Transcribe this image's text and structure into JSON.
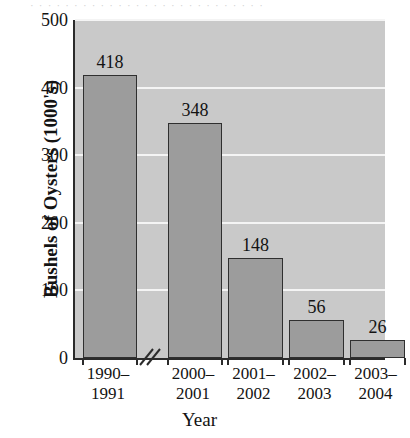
{
  "chart_data": {
    "type": "bar",
    "title": "",
    "xlabel": "Year",
    "ylabel": "Bushels of Oysters (1000's)",
    "categories": [
      "1990–1991",
      "2000–2001",
      "2001–2002",
      "2002–2003",
      "2003–2004"
    ],
    "category_lines": [
      [
        "1990–",
        "1991"
      ],
      [
        "2000–",
        "2001"
      ],
      [
        "2001–",
        "2002"
      ],
      [
        "2002–",
        "2003"
      ],
      [
        "2003–",
        "2004"
      ]
    ],
    "values": [
      418,
      348,
      148,
      56,
      26
    ],
    "value_labels": [
      "418",
      "348",
      "148",
      "56",
      "26"
    ],
    "ylim": [
      0,
      500
    ],
    "yticks": [
      0,
      100,
      200,
      300,
      400,
      500
    ],
    "ytick_labels": [
      "0",
      "100",
      "200",
      "300",
      "400",
      "500"
    ],
    "grid": true,
    "grid_color": "#f4f4f4",
    "legend": "none",
    "axis_break": {
      "present": true,
      "location": "x-axis between category 1 and category 2",
      "symbol": "double-slash"
    },
    "colors": {
      "bar_fill": "#9c9c9c",
      "bar_edge": "#2f2f2f",
      "plot_background": "#c9c9c9",
      "axis": "#2b2b2b",
      "text": "#131313",
      "page_background": "#ffffff"
    }
  },
  "figure": {
    "caption_strip": "· · · · · · · · · · · · · · · · · · · · · · · · · · ·"
  }
}
